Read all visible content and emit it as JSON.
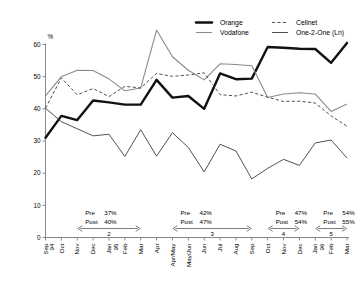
{
  "chart_data": {
    "type": "line",
    "title": "",
    "xlabel": "",
    "ylabel": "%",
    "ylim": [
      0,
      60
    ],
    "yticks": [
      0,
      10,
      20,
      30,
      40,
      50,
      60
    ],
    "grid": false,
    "legend_position": "top-right",
    "categories": [
      "Sep 94",
      "Oct",
      "Nov",
      "Dec",
      "Jan 95",
      "Feb",
      "Mar",
      "Apr",
      "Apr/May",
      "May/Jun",
      "Jun",
      "Jul",
      "Aug",
      "Sep",
      "Oct",
      "Nov",
      "Dec",
      "Jan 96",
      "Feb",
      "Mar"
    ],
    "series": [
      {
        "name": "Orange",
        "style": "solid-thick",
        "color": "#111111",
        "values": [
          31.0,
          37.8,
          36.5,
          42.6,
          42.0,
          41.3,
          41.3,
          49.0,
          43.5,
          44.0,
          40.0,
          51.0,
          49.2,
          49.4,
          59.2,
          59.0,
          58.7,
          58.6,
          54.3,
          60.5
        ]
      },
      {
        "name": "Vodafone",
        "style": "solid-grey",
        "color": "#8a8a8a",
        "values": [
          44.0,
          50.0,
          52.0,
          51.9,
          49.3,
          45.6,
          46.5,
          64.5,
          56.2,
          52.0,
          49.0,
          54.0,
          53.8,
          53.4,
          43.5,
          44.6,
          45.0,
          44.6,
          39.2,
          41.5
        ]
      },
      {
        "name": "Cellnet",
        "style": "dashed",
        "color": "#4f4f4f",
        "values": [
          40.2,
          49.6,
          44.4,
          46.3,
          43.8,
          47.0,
          46.5,
          51.0,
          50.1,
          50.5,
          51.2,
          44.4,
          44.0,
          45.2,
          43.6,
          42.3,
          42.4,
          41.8,
          37.8,
          34.6
        ]
      },
      {
        "name": "One-2-One (Ln)",
        "style": "solid-thin",
        "color": "#3d3d3d",
        "values": [
          40.2,
          36.0,
          33.8,
          31.6,
          32.1,
          25.2,
          33.5,
          25.3,
          32.6,
          28.0,
          20.4,
          29.0,
          26.9,
          18.2,
          21.5,
          24.3,
          22.4,
          29.4,
          30.3,
          24.7
        ]
      }
    ],
    "annotations": [
      {
        "id": "2",
        "pre_label": "Pre",
        "pre_value": "37%",
        "post_label": "Post",
        "post_value": "40%",
        "start_index": 2,
        "end_index": 6
      },
      {
        "id": "3",
        "pre_label": "Pre",
        "pre_value": "42%",
        "post_label": "Post",
        "post_value": "47%",
        "start_index": 8,
        "end_index": 13
      },
      {
        "id": "4",
        "pre_label": "Pre",
        "pre_value": "47%",
        "post_label": "Post",
        "post_value": "54%",
        "start_index": 14,
        "end_index": 16
      },
      {
        "id": "5",
        "pre_label": "Pre",
        "pre_value": "54%",
        "post_label": "Post",
        "post_value": "55%",
        "start_index": 17,
        "end_index": 19
      }
    ]
  },
  "legend": {
    "items": [
      {
        "label": "Orange"
      },
      {
        "label": "Vodafone"
      },
      {
        "label": "Cellnet"
      },
      {
        "label": "One-2-One (Ln)"
      }
    ]
  },
  "axis": {
    "unit": "%",
    "y_labels": [
      "60",
      "50",
      "40",
      "30",
      "20",
      "10",
      "0"
    ],
    "x_labels": [
      "Sep 94",
      "Oct",
      "Nov",
      "Dec",
      "Jan 95",
      "Feb",
      "Mar",
      "Apr",
      "Apr/May",
      "May/Jun",
      "Jun",
      "Jul",
      "Aug",
      "Sep",
      "Oct",
      "Nov",
      "Dec",
      "Jan 96",
      "Feb",
      "Mar"
    ]
  }
}
